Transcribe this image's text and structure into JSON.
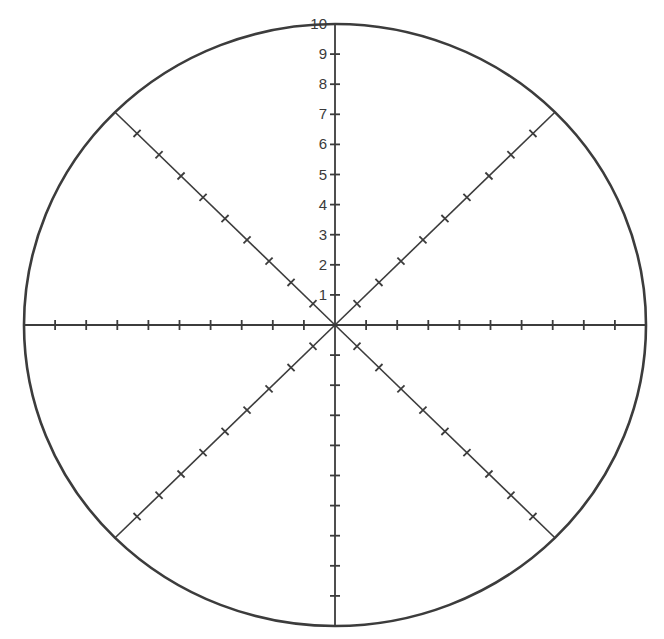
{
  "diagram": {
    "type": "polar-grid",
    "center": [
      335,
      325
    ],
    "radius_x": 311,
    "radius_y": 301,
    "colors": {
      "stroke": "#3c3c3c",
      "label": "#3a3a3a",
      "background": "#ffffff"
    },
    "scale": {
      "min": 0,
      "max": 10,
      "step": 1,
      "labels": [
        "1",
        "2",
        "3",
        "4",
        "5",
        "6",
        "7",
        "8",
        "9",
        "10"
      ]
    },
    "spokes": [
      {
        "name": "north",
        "angle_deg": 90,
        "ticks": 10,
        "labeled": true
      },
      {
        "name": "south",
        "angle_deg": 270,
        "ticks": 9,
        "labeled": false
      },
      {
        "name": "east",
        "angle_deg": 0,
        "ticks": 9,
        "labeled": false
      },
      {
        "name": "west",
        "angle_deg": 180,
        "ticks": 9,
        "labeled": false
      },
      {
        "name": "north-east",
        "angle_deg": 45,
        "ticks": 9,
        "labeled": false
      },
      {
        "name": "north-west",
        "angle_deg": 135,
        "ticks": 9,
        "labeled": false
      },
      {
        "name": "south-east",
        "angle_deg": 315,
        "ticks": 9,
        "labeled": false
      },
      {
        "name": "south-west",
        "angle_deg": 225,
        "ticks": 9,
        "labeled": false
      }
    ]
  }
}
